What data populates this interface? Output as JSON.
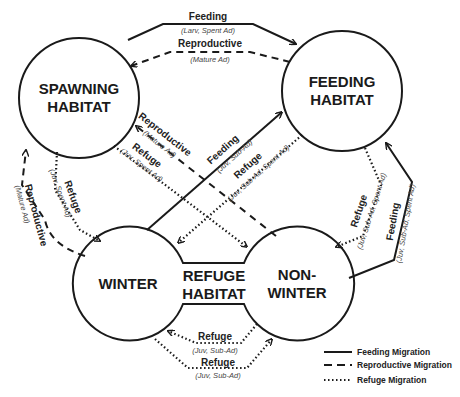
{
  "nodes": {
    "spawning": {
      "line1": "SPAWNING",
      "line2": "HABITAT"
    },
    "feeding": {
      "line1": "FEEDING",
      "line2": "HABITAT"
    },
    "winter": {
      "label": "WINTER"
    },
    "refuge": {
      "line1": "REFUGE",
      "line2": "HABITAT"
    },
    "nonwinter": {
      "line1": "NON-",
      "line2": "WINTER"
    }
  },
  "edges": {
    "spawn_to_feed": {
      "label": "Feeding",
      "sub": "(Larv, Spent Ad)",
      "type": "feeding"
    },
    "feed_to_spawn": {
      "label": "Reproductive",
      "sub": "(Mature Ad)",
      "type": "reproductive"
    },
    "nonwinter_to_spawn": {
      "label": "Reproductive",
      "sub": "(Mature Ad)",
      "type": "reproductive"
    },
    "spawn_to_nonwinter": {
      "label": "Refuge",
      "sub": "(Juv, Spent Ad)",
      "type": "refuge"
    },
    "winter_to_feed": {
      "label": "Feeding",
      "sub": "(Juv, Sub-Ad)",
      "type": "feeding"
    },
    "feed_to_winter": {
      "label": "Refuge",
      "sub": "(Juv, Sub-Ad, Spent Ad)",
      "type": "refuge"
    },
    "winter_to_spawn": {
      "label": "Reproductive",
      "sub": "(Mature Ad)",
      "type": "reproductive"
    },
    "spawn_to_winter": {
      "label": "Refuge",
      "sub": "(Juv, Spent Ad)",
      "type": "refuge"
    },
    "feed_to_nonwinter": {
      "label": "Refuge",
      "sub": "(Juv, Sub-Ad, Spent Ad)",
      "type": "refuge"
    },
    "nonwinter_to_feed": {
      "label": "Feeding",
      "sub": "(Juv, Sub-Ad, Spent Ad)",
      "type": "feeding"
    },
    "nonwinter_to_winter": {
      "label": "Refuge",
      "sub": "(Juv, Sub-Ad)",
      "type": "refuge"
    },
    "winter_to_nonwinter": {
      "label": "Refuge",
      "sub": "(Juv, Sub-Ad)",
      "type": "refuge"
    }
  },
  "legend": {
    "feeding": "Feeding Migration",
    "reproductive": "Reproductive Migration",
    "refuge": "Refuge Migration"
  },
  "colors": {
    "stroke": "#1a1a1a",
    "background": "#ffffff"
  }
}
